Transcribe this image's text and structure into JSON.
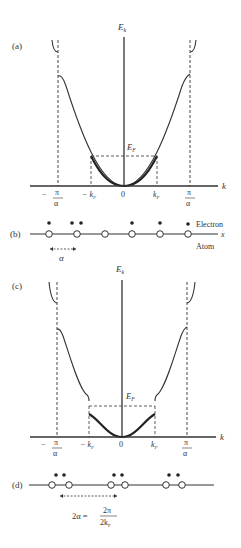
{
  "figure": {
    "panel_a": {
      "label": "(a)",
      "y_axis": "E",
      "y_axis_sub": "k",
      "x_axis": "k",
      "fermi": "E",
      "fermi_sub": "F",
      "ticks": {
        "neg_pi_minus": "−",
        "pi_num": "π",
        "alpha_den": "α",
        "neg_kf": "− k",
        "kf_sub": "F",
        "zero": "0",
        "kf": "k"
      }
    },
    "panel_b": {
      "label": "(b)",
      "electron_label": "Electron",
      "atom_label": "Atom",
      "x_label": "x",
      "spacing_label": "α"
    },
    "panel_c": {
      "label": "(c)",
      "y_axis": "E",
      "y_axis_sub": "k",
      "x_axis": "k",
      "fermi": "E",
      "fermi_sub": "F",
      "ticks": {
        "neg_pi_minus": "−",
        "pi_num": "π",
        "alpha_den": "α",
        "neg_kf": "− k",
        "kf_sub": "F",
        "zero": "0",
        "kf": "k"
      }
    },
    "panel_d": {
      "label": "(d)",
      "formula_lhs": "2α =",
      "formula_num": "2π",
      "formula_den": "2k",
      "formula_den_sub": "F"
    }
  }
}
